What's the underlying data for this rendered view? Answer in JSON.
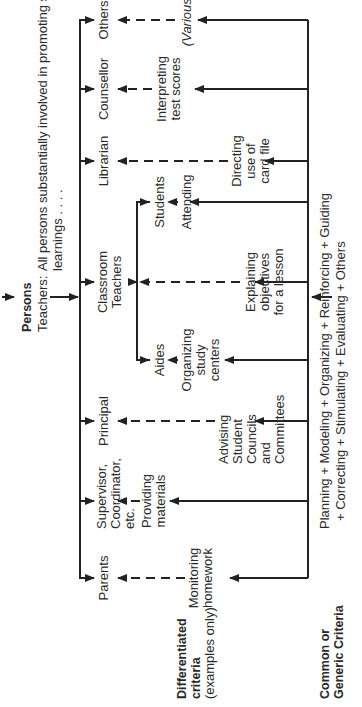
{
  "header": {
    "title": "Persons",
    "teachers_prefix": "Teachers:",
    "teachers_line1": "All persons substantially involved in promoting student",
    "teachers_line2": "learnings . . . ."
  },
  "persons": [
    {
      "label": "Parents"
    },
    {
      "label_lines": [
        "Supervisor,",
        "Coordinator,",
        "etc."
      ]
    },
    {
      "label": "Principal"
    },
    {
      "label_lines": [
        "Classroom",
        "Teachers"
      ]
    },
    {
      "label": "Librarian"
    },
    {
      "label": "Counsellor"
    },
    {
      "label": "Others"
    }
  ],
  "sub_persons": {
    "aides": "Aides",
    "students": "Students"
  },
  "differentiated": {
    "title_lines": [
      "Differentiated",
      "criteria"
    ],
    "subtitle": "(examples only)",
    "items": {
      "monitoring": [
        "Monitoring",
        "homework"
      ],
      "providing": [
        "Providing",
        "materials"
      ],
      "advising": [
        "Advising",
        "Student",
        "Councils",
        "and",
        "Committees"
      ],
      "organizing": [
        "Organizing",
        "study",
        "centers"
      ],
      "explaining": [
        "Explaining",
        "objectives",
        "for a lesson"
      ],
      "attending": [
        "Attending"
      ],
      "directing": [
        "Directing",
        "use of",
        "card file"
      ],
      "interpreting": [
        "Interpreting",
        "test scores"
      ],
      "various": "(Various)"
    }
  },
  "common": {
    "title_lines": [
      "Common or",
      "Generic Criteria"
    ],
    "line1": "Planning + Modeling + Organizing + Reinforcing + Guiding",
    "line2": "+ Correcting + Stimulating + Evaluating + Others"
  }
}
